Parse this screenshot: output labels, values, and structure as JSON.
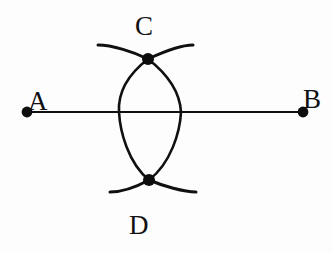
{
  "figure": {
    "background_color": "#fdfdfd",
    "ink_color": "#101010",
    "width": 332,
    "height": 253,
    "labels": {
      "a": "A",
      "b": "B",
      "c": "C",
      "d": "D"
    },
    "points": [
      {
        "name": "A",
        "label": "A",
        "x": 27,
        "y": 112
      },
      {
        "name": "B",
        "label": "B",
        "x": 303,
        "y": 112
      },
      {
        "name": "C",
        "label": "C",
        "x": 148,
        "y": 59
      },
      {
        "name": "D",
        "label": "D",
        "x": 149,
        "y": 180
      }
    ],
    "segments": [
      {
        "name": "segment-AB",
        "from": "A",
        "to": "B",
        "x1": 27,
        "y1": 112,
        "x2": 303,
        "y2": 112
      }
    ],
    "arcs": {
      "lens_left": {
        "name": "arc-lens-left",
        "from": "C",
        "to": "D",
        "bulge_x": 119
      },
      "lens_right": {
        "name": "arc-lens-right",
        "from": "C",
        "to": "D",
        "bulge_x": 181
      },
      "compass_top": {
        "name": "arc-compass-top",
        "x_start": 98,
        "x_end": 193,
        "y_ends": 45,
        "through_y": 59
      },
      "compass_bottom": {
        "name": "arc-compass-bottom",
        "x_start": 110,
        "x_end": 196,
        "y_ends": 192,
        "through_y": 180
      }
    },
    "dot_radius": 5.2
  }
}
